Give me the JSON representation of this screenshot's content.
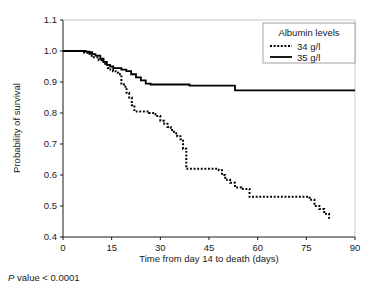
{
  "figure": {
    "pvalue_prefix": "P",
    "pvalue_text": " value < 0.0001"
  },
  "chart_data": {
    "type": "line",
    "subtype": "kaplan-meier-step",
    "title": "",
    "xlabel": "Time from day 14 to death (days)",
    "ylabel": "Probability of survival",
    "xlim": [
      0,
      90
    ],
    "ylim": [
      0.4,
      1.1
    ],
    "xticks": [
      0,
      15,
      30,
      45,
      60,
      75,
      90
    ],
    "xtick_labels": [
      "0",
      "15",
      "30",
      "45",
      "60",
      "75",
      "90"
    ],
    "yticks": [
      0.4,
      0.5,
      0.6,
      0.7,
      0.8,
      0.9,
      1.0,
      1.1
    ],
    "ytick_labels": [
      "0.4",
      "0.5",
      "0.6",
      "0.7",
      "0.8",
      "0.9",
      "1.0",
      "1.1"
    ],
    "grid": false,
    "legend": {
      "title": "Albumin levels",
      "position": "top-right",
      "entries": [
        {
          "label": "34 g/l",
          "style": "dotted",
          "color": "#000000"
        },
        {
          "label": "35 g/l",
          "style": "solid",
          "color": "#000000"
        }
      ]
    },
    "annotations": [
      {
        "text": "P value < 0.0001",
        "position": "below-axis-left"
      }
    ],
    "series": [
      {
        "name": "34 g/l",
        "style": "dotted",
        "color": "#000000",
        "x": [
          0,
          5.5,
          6.5,
          7.5,
          8.5,
          9.5,
          11.0,
          12.0,
          13.0,
          13.8,
          14.6,
          15.4,
          16.2,
          17.0,
          18.0,
          18.8,
          19.6,
          20.4,
          21.2,
          22.0,
          25.5,
          26.5,
          28.5,
          30.0,
          31.2,
          32.2,
          33.2,
          34.2,
          35.2,
          36.2,
          37.0,
          38.0,
          47.0,
          48.0,
          49.0,
          50.0,
          51.5,
          53.0,
          55.0,
          57.5,
          74.5,
          76.0,
          77.5,
          79.0,
          80.5,
          82.0
        ],
        "y": [
          1.0,
          1.0,
          0.995,
          0.99,
          0.985,
          0.98,
          0.97,
          0.965,
          0.955,
          0.945,
          0.94,
          0.935,
          0.93,
          0.925,
          0.895,
          0.885,
          0.865,
          0.85,
          0.825,
          0.805,
          0.805,
          0.8,
          0.79,
          0.775,
          0.765,
          0.755,
          0.745,
          0.735,
          0.725,
          0.715,
          0.685,
          0.62,
          0.62,
          0.615,
          0.6,
          0.585,
          0.575,
          0.56,
          0.555,
          0.53,
          0.53,
          0.52,
          0.5,
          0.49,
          0.475,
          0.455
        ]
      },
      {
        "name": "35 g/l",
        "style": "solid",
        "color": "#000000",
        "x": [
          0,
          6.0,
          7.0,
          8.0,
          9.0,
          10.0,
          11.5,
          12.5,
          13.5,
          14.5,
          15.5,
          16.5,
          18.0,
          19.5,
          21.0,
          22.5,
          24.0,
          25.5,
          27.0,
          37.5,
          39.0,
          51.5,
          53.0,
          90.0
        ],
        "y": [
          1.0,
          1.0,
          0.998,
          0.996,
          0.99,
          0.985,
          0.975,
          0.965,
          0.955,
          0.95,
          0.945,
          0.945,
          0.94,
          0.935,
          0.925,
          0.915,
          0.905,
          0.895,
          0.892,
          0.892,
          0.888,
          0.888,
          0.873,
          0.873
        ]
      }
    ]
  }
}
